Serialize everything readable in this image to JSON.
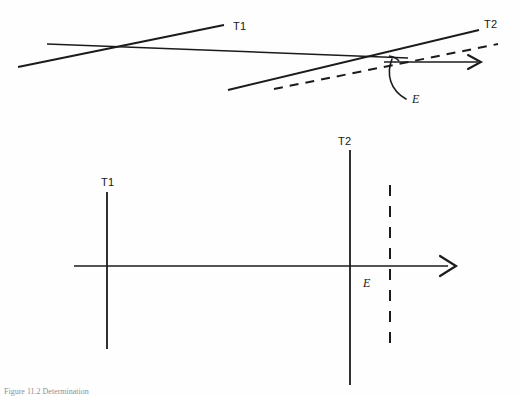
{
  "figure": {
    "caption": "Figure 11.2  Determination",
    "background_color": "#fefefe",
    "ink_color": "#1b1b1e",
    "panels": [
      {
        "id": "upper-panel",
        "name": "oblique-tangent-panel",
        "description": "Oblique view showing tangent lines T1 and T2 crossing a horizontal reference line, with dashed projection and angle E",
        "labels": [
          {
            "key": "t1",
            "text": "T1",
            "x": 233,
            "y": 30,
            "style": "upright"
          },
          {
            "key": "t2",
            "text": "T2",
            "x": 484,
            "y": 28,
            "style": "upright"
          },
          {
            "key": "e",
            "text": "E",
            "x": 412,
            "y": 103,
            "style": "italic"
          }
        ],
        "elements": {
          "horizontal_reference_line": {
            "x1": 47,
            "y1": 44,
            "x2": 408,
            "y2": 58
          },
          "t1_line": {
            "x1": 18,
            "y1": 67,
            "x2": 224,
            "y2": 25
          },
          "t2_line": {
            "x1": 228,
            "y1": 90,
            "x2": 479,
            "y2": 30
          },
          "dashed_projection": {
            "x1": 274,
            "y1": 89,
            "x2": 498,
            "y2": 44
          },
          "direction_arrow": {
            "x1": 384,
            "y1": 62,
            "x2": 481,
            "y2": 62
          },
          "angle_leader": {
            "from_x": 393,
            "from_y": 58,
            "to_x": 407,
            "to_y": 98
          }
        }
      },
      {
        "id": "lower-panel",
        "name": "orthogonal-axis-panel",
        "description": "Plan view with horizontal axis arrow, vertical lines T1 and T2, a dashed vertical line, and the point E marked on the axis",
        "labels": [
          {
            "key": "t1",
            "text": "T1",
            "x": 101,
            "y": 186,
            "style": "upright"
          },
          {
            "key": "t2",
            "text": "T2",
            "x": 338,
            "y": 145,
            "style": "upright"
          },
          {
            "key": "e",
            "text": "E",
            "x": 363,
            "y": 287,
            "style": "italic"
          }
        ],
        "elements": {
          "horizontal_axis": {
            "x1": 74,
            "y1": 266,
            "x2": 450,
            "y2": 266
          },
          "t1_vertical": {
            "x": 107,
            "y1": 192,
            "y2": 349
          },
          "t2_vertical": {
            "x": 350,
            "y1": 150,
            "y2": 385
          },
          "dashed_vertical": {
            "x": 390,
            "y1": 185,
            "y2": 345
          },
          "axis_arrow_tip": {
            "x": 456,
            "y": 266
          }
        }
      }
    ]
  }
}
